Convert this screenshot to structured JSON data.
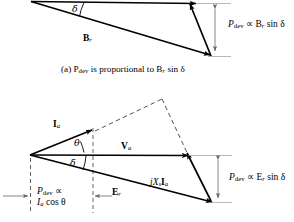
{
  "figure": {
    "panels": [
      {
        "id": "panel-a",
        "caption": "(a) P",
        "caption_sub": "dev",
        "caption_rest": " is proportional to B",
        "caption_sub2": "r",
        "caption_tail": " sin δ",
        "caption_full": "(a) Pdev is proportional to Br sin δ",
        "labels": {
          "br_vector": "B",
          "br_sub": "r",
          "delta_angle": "δ",
          "dimension_p": "P",
          "dimension_p_sub": "dev",
          "dimension_prop": " ∝ B",
          "dimension_sub2": "r",
          "dimension_tail": " sin δ",
          "dimension_full": "Pdev ∝ Br sin δ"
        }
      },
      {
        "id": "panel-b",
        "labels": {
          "ia_vector": "I",
          "ia_sub": "a",
          "va_vector": "V",
          "va_sub": "a",
          "er_vector": "E",
          "er_sub": "r",
          "jxsia": "jX",
          "jxsia_sub": "s",
          "jxsia_vec": "I",
          "jxsia_vec_sub": "a",
          "jxsia_full": "jXsIa",
          "theta_angle": "θ",
          "delta_angle": "δ",
          "dimension_right_p": "P",
          "dimension_right_sub": "dev",
          "dimension_right_prop": " ∝ E",
          "dimension_right_sub2": "r",
          "dimension_right_tail": " sin δ",
          "dimension_right_full": "Pdev ∝ Er sin δ",
          "dimension_bottom_line1_p": "P",
          "dimension_bottom_line1_sub": "dev",
          "dimension_bottom_line1_prop": " ∝",
          "dimension_bottom_line2_i": "I",
          "dimension_bottom_line2_sub": "a",
          "dimension_bottom_line2_tail": " cos θ",
          "dimension_bottom_full": "Pdev ∝ Ia cos θ"
        }
      }
    ],
    "colors": {
      "ink": "#000000",
      "background": "#ffffff",
      "thin_rule": "#808080"
    }
  }
}
